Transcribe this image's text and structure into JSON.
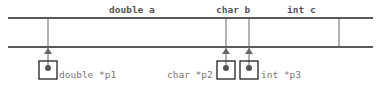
{
  "diagram": {
    "variables": [
      {
        "id": "a",
        "label": "double a"
      },
      {
        "id": "b",
        "label": "char b"
      },
      {
        "id": "c",
        "label": "int c"
      }
    ],
    "pointers": [
      {
        "id": "p1",
        "label": "double *p1",
        "targets": "a"
      },
      {
        "id": "p2",
        "label": "char *p2",
        "targets": "b"
      },
      {
        "id": "p3",
        "label": "int *p3",
        "targets": "b"
      }
    ],
    "colors": {
      "memory_line": "#222222",
      "pointer_line": "#666666",
      "box_border": "#222222",
      "dot": "#555555",
      "variable_label": "#555555",
      "pointer_label": "#777777"
    }
  }
}
